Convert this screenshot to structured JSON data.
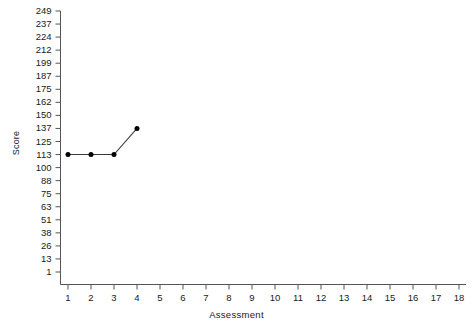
{
  "chart_data": {
    "type": "line",
    "title": "",
    "xlabel": "Assessment",
    "ylabel": "Score",
    "grid": false,
    "legend": false,
    "x": [
      1,
      2,
      3,
      4
    ],
    "values": [
      113,
      113,
      113,
      137
    ],
    "series": [
      {
        "name": "Score",
        "x": [
          1,
          2,
          3,
          4
        ],
        "values": [
          113,
          113,
          113,
          137
        ],
        "marker": "filled-circle",
        "color": "#000000"
      }
    ],
    "xlim": [
      0.5,
      18.5
    ],
    "ylim": [
      1,
      249
    ],
    "xticks": [
      1,
      2,
      3,
      4,
      5,
      6,
      7,
      8,
      9,
      10,
      11,
      12,
      13,
      14,
      15,
      16,
      17,
      18
    ],
    "xticklabels": [
      "1",
      "2",
      "3",
      "4",
      "5",
      "6",
      "7",
      "8",
      "9",
      "10",
      "11",
      "12",
      "13",
      "14",
      "15",
      "16",
      "17",
      "18"
    ],
    "yticks": [
      1,
      13,
      26,
      38,
      51,
      63,
      75,
      88,
      100,
      113,
      125,
      137,
      150,
      162,
      175,
      187,
      199,
      212,
      224,
      237,
      249
    ],
    "yticklabels": [
      "1",
      "13",
      "26",
      "38",
      "51",
      "63",
      "75",
      "88",
      "100",
      "113",
      "125",
      "137",
      "150",
      "162",
      "175",
      "187",
      "199",
      "212",
      "224",
      "237",
      "249"
    ],
    "axis_color": "#555555",
    "background": "#ffffff"
  }
}
